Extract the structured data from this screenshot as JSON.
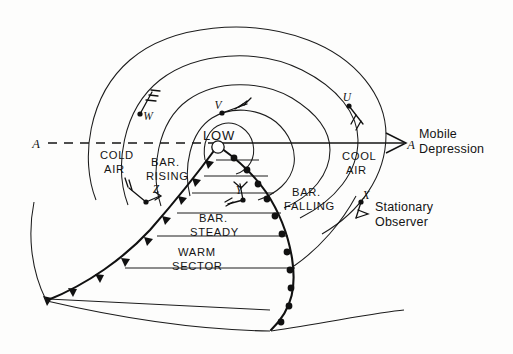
{
  "figure": {
    "type": "meteorological-synoptic-diagram",
    "title_text": "",
    "background": "#fdfdfc",
    "ink_color": "#141414"
  },
  "center": {
    "low_label": "LOW"
  },
  "axis": {
    "left_label": "A",
    "right_label": "A",
    "annotation_line1": "Mobile",
    "annotation_line2": "Depression"
  },
  "air_masses": {
    "cold_line1": "COLD",
    "cold_line2": "AIR",
    "cool_line1": "COOL",
    "cool_line2": "AIR",
    "warm_line1": "WARM",
    "warm_line2": "SECTOR"
  },
  "pressure_tendency": {
    "rising_line1": "BAR.",
    "rising_line2": "RISING",
    "steady_line1": "BAR.",
    "steady_line2": "STEADY",
    "falling_line1": "BAR.",
    "falling_line2": "FALLING"
  },
  "observer": {
    "line1": "Stationary",
    "line2": "Observer",
    "station_label": "X"
  },
  "stations": [
    {
      "id": "U",
      "label": "U",
      "x": 349,
      "y": 99,
      "dot_x": 349,
      "dot_y": 106,
      "wind": "barb-down-right"
    },
    {
      "id": "V",
      "label": "V",
      "x": 219,
      "y": 104,
      "dot_x": 222,
      "dot_y": 113,
      "wind": "barb-right"
    },
    {
      "id": "W",
      "label": "W",
      "x": 146,
      "y": 116,
      "dot_x": 140,
      "dot_y": 114,
      "wind": "barb-up-right"
    },
    {
      "id": "X",
      "label": "X",
      "x": 367,
      "y": 195,
      "dot_x": 361,
      "dot_y": 202,
      "wind": "barb-down-right-small"
    },
    {
      "id": "Y",
      "label": "Y",
      "x": 240,
      "y": 195,
      "dot_x": 243,
      "dot_y": 200,
      "wind": "barb-up-left"
    },
    {
      "id": "Z",
      "label": "Z",
      "x": 151,
      "y": 193,
      "dot_x": 146,
      "dot_y": 202,
      "wind": "barb-up-left"
    }
  ],
  "fronts": {
    "cold_front": {
      "name": "cold-front",
      "symbol": "filled-triangles"
    },
    "warm_front": {
      "name": "warm-front",
      "symbol": "filled-semicircles"
    }
  },
  "isobars": {
    "count": 5,
    "shape": "concentric-ellipses"
  }
}
